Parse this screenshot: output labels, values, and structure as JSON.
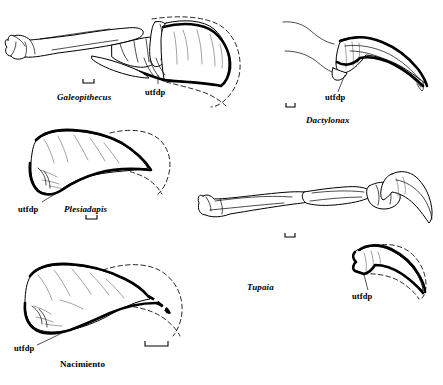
{
  "figure": {
    "type": "comparative-anatomical-line-drawing",
    "background_color": "#ffffff",
    "ink_color": "#000000",
    "annotation_label": "utfdp",
    "specimens": [
      {
        "id": "galeopithecus",
        "taxon": "Galeopithecus",
        "italic": true,
        "position": "top-left",
        "description": "full digit with proximal and middle phalanges plus broad flattened terminal phalanx",
        "has_dashed_sheath": true,
        "utfdp_label": "utfdp",
        "caption_x": 57,
        "caption_y": 93,
        "utfdp_x": 145,
        "utfdp_y": 88,
        "scalebar": {
          "x": 83,
          "y": 82,
          "width": 11,
          "tick": 3
        }
      },
      {
        "id": "dactylonax",
        "taxon": "Dactylonax",
        "italic": true,
        "position": "top-right",
        "description": "strongly curved narrow falciform claw phalanx",
        "has_dashed_sheath": false,
        "utfdp_label": "utfdp",
        "caption_x": 306,
        "caption_y": 116,
        "utfdp_x": 325,
        "utfdp_y": 96,
        "scalebar": {
          "x": 286,
          "y": 106,
          "width": 9,
          "tick": 3
        }
      },
      {
        "id": "plesiadapis",
        "taxon": "Plesiadapis",
        "italic": true,
        "position": "middle-left",
        "description": "deep fossil terminal phalanx with large flexor tubercle",
        "has_dashed_sheath": true,
        "utfdp_label": "utfdp",
        "caption_x": 64,
        "caption_y": 207,
        "utfdp_x": 24,
        "utfdp_y": 207,
        "scalebar": {
          "x": 86,
          "y": 218,
          "width": 11,
          "tick": 3
        }
      },
      {
        "id": "tupaia",
        "taxon": "Tupaia",
        "italic": true,
        "position": "middle-right",
        "description": "complete digit skeleton with slender curved claw, plus enlarged terminal phalanx inset below",
        "has_dashed_sheath": true,
        "utfdp_label": "utfdp",
        "caption_x": 247,
        "caption_y": 285,
        "utfdp_x": 352,
        "utfdp_y": 295,
        "scalebar": {
          "x": 285,
          "y": 236,
          "width": 10,
          "tick": 3
        }
      },
      {
        "id": "nacimiento",
        "taxon": "Nacimiento",
        "italic": false,
        "position": "bottom-left",
        "description": "fossil terminal phalanx with heavy dashed reconstructed margin",
        "has_dashed_sheath": true,
        "utfdp_label": "utfdp",
        "caption_x": 60,
        "caption_y": 362,
        "utfdp_x": 16,
        "utfdp_y": 348,
        "scalebar": {
          "x": 145,
          "y": 345,
          "width": 23,
          "tick": 4
        }
      }
    ]
  }
}
